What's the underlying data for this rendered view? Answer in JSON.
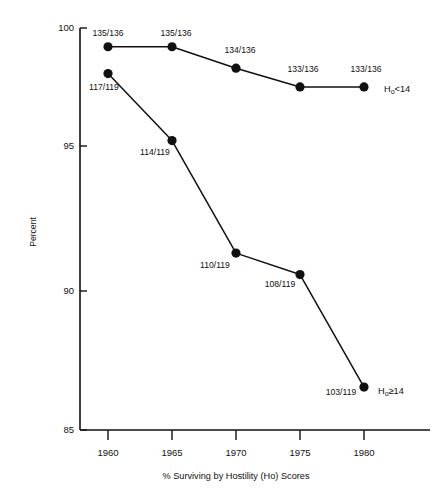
{
  "chart_data": {
    "type": "line",
    "title": "",
    "xlabel": "% Surviving by Hostility (Ho) Scores",
    "ylabel": "Percent",
    "x": [
      1960,
      1965,
      1970,
      1975,
      1980
    ],
    "xtick_labels": [
      "1960",
      "1965",
      "1970",
      "1975",
      "1980"
    ],
    "ytick_labels": [
      "85",
      "90",
      "95",
      "100"
    ],
    "yticks": [
      85,
      90,
      95,
      100
    ],
    "xlim": [
      1958.5,
      1982.5
    ],
    "ylim": [
      85,
      100
    ],
    "grid": false,
    "legend_position": "right-of-last-point",
    "series": [
      {
        "name": "Ho<14",
        "label_text": "Ho<14",
        "label_main": "H",
        "label_sub": "o",
        "label_tail": "<14",
        "values": [
          99.3,
          99.3,
          98.5,
          97.8,
          97.8
        ],
        "point_labels": [
          "135/136",
          "135/136",
          "134/136",
          "133/136",
          "133/136"
        ],
        "color": "#111111"
      },
      {
        "name": "Ho≥14",
        "label_text": "Ho≥14",
        "label_main": "H",
        "label_sub": "o",
        "label_tail": "≥14",
        "values": [
          98.3,
          95.8,
          91.6,
          90.8,
          86.6
        ],
        "point_labels": [
          "117/119",
          "114/119",
          "110/119",
          "108/119",
          "103/119"
        ],
        "color": "#111111"
      }
    ]
  },
  "axes": {
    "y_axis_name": "percent-axis",
    "x_axis_name": "year-axis"
  },
  "colors": {
    "ink": "#111111",
    "background": "#ffffff"
  }
}
